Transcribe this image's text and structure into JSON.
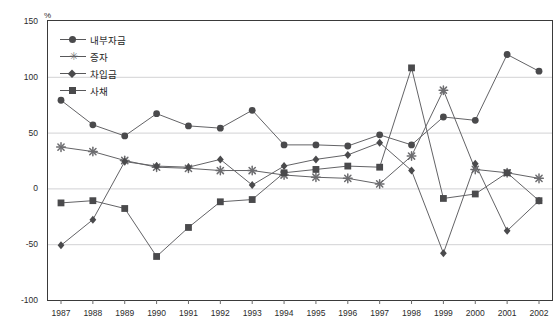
{
  "chart_data": {
    "type": "line",
    "title": "",
    "xlabel": "",
    "ylabel": "%",
    "unit_label": "%",
    "ylim": [
      -100,
      150
    ],
    "yticks": [
      150,
      100,
      50,
      0,
      -50,
      -100
    ],
    "grid": true,
    "grid_axis": "y",
    "legend_position": "inside-top-left",
    "categories": [
      "1987",
      "1988",
      "1989",
      "1990",
      "1991",
      "1992",
      "1993",
      "1994",
      "1995",
      "1996",
      "1997",
      "1998",
      "1999",
      "2000",
      "2001",
      "2002"
    ],
    "x": [
      1987,
      1988,
      1989,
      1990,
      1991,
      1992,
      1993,
      1994,
      1995,
      1996,
      1997,
      1998,
      1999,
      2000,
      2001,
      2002
    ],
    "series": [
      {
        "name": "내부자금",
        "marker": "circle",
        "color": "#4a4a4c",
        "values": [
          79,
          57,
          47,
          67,
          56,
          54,
          70,
          39,
          39,
          38,
          48,
          39,
          64,
          61,
          120,
          105
        ]
      },
      {
        "name": "증자",
        "marker": "star",
        "color": "#6d6d70",
        "values": [
          37,
          33,
          25,
          19,
          18,
          16,
          16,
          12,
          10,
          9,
          4,
          29,
          88,
          17,
          14,
          9
        ]
      },
      {
        "name": "차입금",
        "marker": "diamond",
        "color": "#4a4a4c",
        "values": [
          -51,
          -28,
          24,
          20,
          19,
          26,
          3,
          20,
          26,
          30,
          41,
          16,
          -58,
          22,
          -38,
          -11
        ]
      },
      {
        "name": "사채",
        "marker": "square",
        "color": "#4a4a4c",
        "values": [
          -13,
          -11,
          -18,
          -61,
          -35,
          -12,
          -10,
          14,
          17,
          20,
          19,
          108,
          -9,
          -5,
          14,
          -11
        ]
      }
    ]
  },
  "legend": {
    "items": [
      {
        "label": "내부자금",
        "marker": "circle"
      },
      {
        "label": "증자",
        "marker": "star"
      },
      {
        "label": "차입금",
        "marker": "diamond"
      },
      {
        "label": "사채",
        "marker": "square"
      }
    ]
  },
  "axes": {
    "unit": "%",
    "y_ticks": [
      "150",
      "100",
      "50",
      "0",
      "-50",
      "-100"
    ],
    "x_ticks": [
      "1987",
      "1988",
      "1989",
      "1990",
      "1991",
      "1992",
      "1993",
      "1994",
      "1995",
      "1996",
      "1997",
      "1998",
      "1999",
      "2000",
      "2001",
      "2002"
    ]
  }
}
